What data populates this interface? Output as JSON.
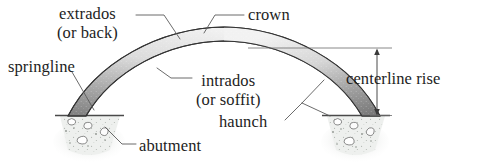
{
  "diagram": {
    "background_color": "#ffffff",
    "text_color": "#1d1d1d",
    "line_color": "#5a5a5a",
    "arch_fill_light": "#f2f2f2",
    "arch_fill_dark": "#808080",
    "arch_outline": "#3d3d3d",
    "abutment_fill": "#eceeec",
    "abutment_speckle": "#9aa09a"
  },
  "labels": {
    "extrados_line1": "extrados",
    "extrados_line2": "(or back)",
    "crown": "crown",
    "springline": "springline",
    "intrados_line1": "intrados",
    "intrados_line2": "(or soffit)",
    "haunch": "haunch",
    "centerline_rise": "centerline rise",
    "abutment": "abutment"
  },
  "parts": [
    {
      "name": "extrados",
      "description": "outer curve of the arch, also called the back"
    },
    {
      "name": "crown",
      "description": "highest point of the arch"
    },
    {
      "name": "springline",
      "description": "level at which the arch springs from its support"
    },
    {
      "name": "intrados",
      "description": "inner curve of the arch, also called the soffit"
    },
    {
      "name": "haunch",
      "description": "region between the springline and the crown"
    },
    {
      "name": "centerline rise",
      "description": "vertical height from springline to arch centerline at crown"
    },
    {
      "name": "abutment",
      "description": "masonry support carrying the arch thrust"
    }
  ]
}
